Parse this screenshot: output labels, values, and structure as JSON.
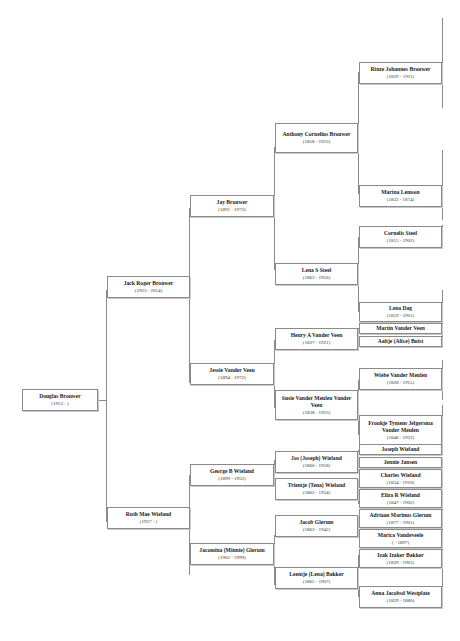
{
  "tree": {
    "root": {
      "name": "Douglas Brouwer",
      "dates": "(1953 - )"
    },
    "gen1": [
      {
        "name": "Jack Roger Brouwer",
        "dates": "(1923 - 2014)"
      },
      {
        "name": "Ruth Mae Wieland",
        "dates": "(1927 - )"
      }
    ],
    "gen2": [
      {
        "name": "Jay Brouwer",
        "dates": "(1891 - 1973)"
      },
      {
        "name": "Jessie Vander Veen",
        "dates": "(1894 - 1972)"
      },
      {
        "name": "George B Wieland",
        "dates": "(1899 - 1952)"
      },
      {
        "name": "Jacomina (Minnie) Glerum",
        "dates": "(1902 - 1999)"
      }
    ],
    "gen3": [
      {
        "name": "Anthony Cornelius Brouwer",
        "dates": "(1858 - 1923)"
      },
      {
        "name": "Lena S Steel",
        "dates": "(1863 - 1916)"
      },
      {
        "name": "Henry A Vander Veen",
        "dates": "(1837 - 1921)"
      },
      {
        "name": "Susie Vander Meulen Vander Veen",
        "dates": "(1838 - 1923)"
      },
      {
        "name": "Jos (Joseph) Wieland",
        "dates": "(1860 - 1918)"
      },
      {
        "name": "Trientje (Tena) Wieland",
        "dates": "(1865 - 1924)"
      },
      {
        "name": "Jacob Glerum",
        "dates": "(1863 - 1942)"
      },
      {
        "name": "Leentje (Lena) Bakker",
        "dates": "(1865 - 1907)"
      }
    ],
    "gen4": [
      {
        "name": "Rinze Johannes Brouwer",
        "dates": "(1829 - 1911)"
      },
      {
        "name": "Marina Lemson",
        "dates": "(1832 - 1874)"
      },
      {
        "name": "Cornelis Steel",
        "dates": "(1815 - 1902)"
      },
      {
        "name": "Lena Dag",
        "dates": "(1819 - 1901)"
      },
      {
        "name": "Martin Vander Veen",
        "dates": ""
      },
      {
        "name": "Aaltje (Alice) Buist",
        "dates": ""
      },
      {
        "name": "Wiebe Vander Meulen",
        "dates": "(1828 - 1915)"
      },
      {
        "name": "Froukje Tymens Jelgersma Vander Meulen",
        "dates": "(1848 - 1922)"
      },
      {
        "name": "Joseph Wieland",
        "dates": ""
      },
      {
        "name": "Jennie Jansen",
        "dates": ""
      },
      {
        "name": "Charles Wieland",
        "dates": "(1834 - 1910)"
      },
      {
        "name": "Eliza R Wieland",
        "dates": "(1847 - 1902)"
      },
      {
        "name": "Adriaan Marinus Glerum",
        "dates": "(1877 - 1901)"
      },
      {
        "name": "Marica Vandeveele",
        "dates": "( - 1897)"
      },
      {
        "name": "Izak Izaker Bakker",
        "dates": "(1839 - 1903)"
      },
      {
        "name": "Anna Jacobsd Westplate",
        "dates": "(1839 - 1880)"
      }
    ]
  },
  "colors": {
    "line": "#8a8a8a",
    "box_border": "#8a8a8a",
    "background": "#ffffff"
  }
}
